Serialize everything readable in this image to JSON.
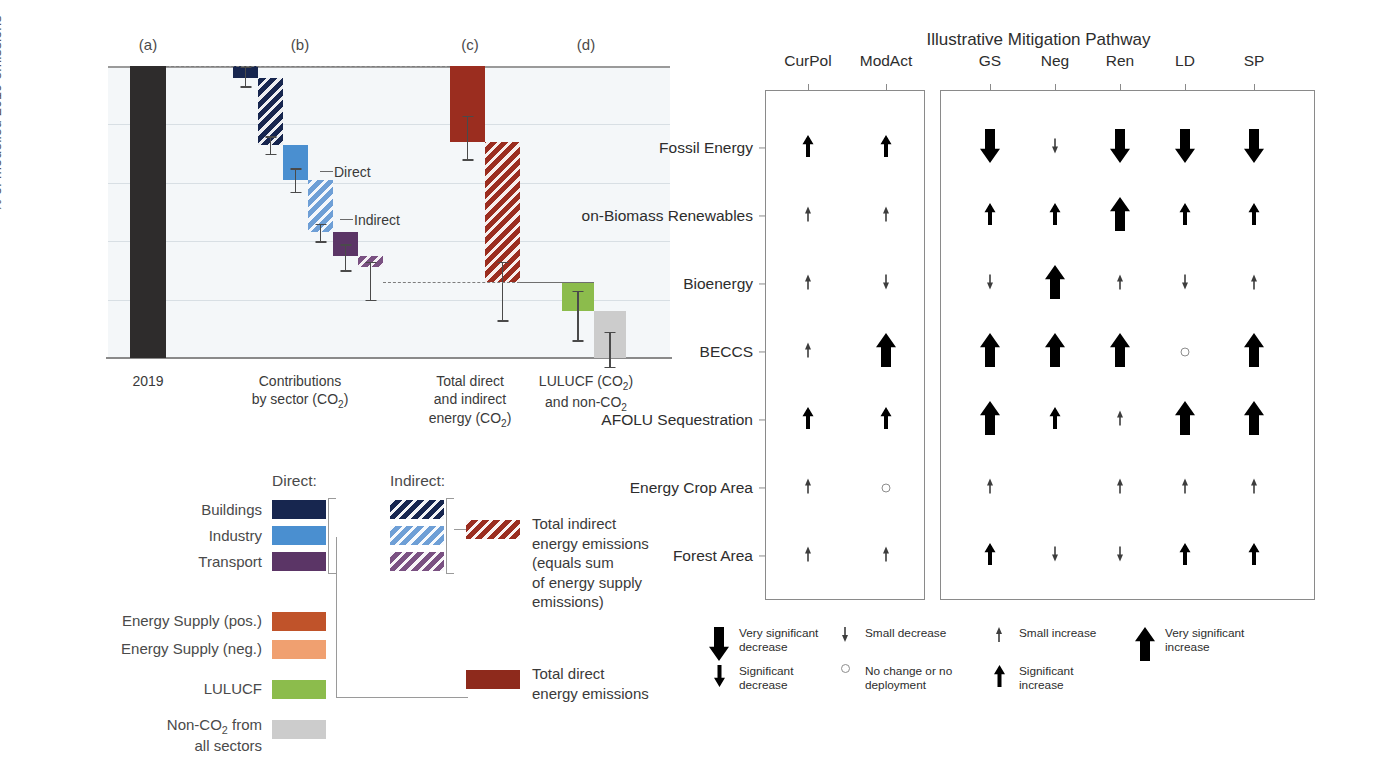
{
  "left_chart": {
    "panel_letters": [
      {
        "label": "(a)",
        "x": 148
      },
      {
        "label": "(b)",
        "x": 300
      },
      {
        "label": "(c)",
        "x": 470
      },
      {
        "label": "(d)",
        "x": 586
      }
    ],
    "y_axis": {
      "label": "% of modelled 2019 emissions",
      "ticks": [
        "100%",
        "80%",
        "60%",
        "40%",
        "20%",
        "0%"
      ],
      "min": 0,
      "max": 100
    },
    "x_categories": [
      {
        "label": "2019",
        "x": 148
      },
      {
        "label": "Contributions\nby sector (CO2)",
        "x": 300
      },
      {
        "label": "Total direct\nand indirect\nenergy (CO2)",
        "x": 470
      },
      {
        "label": "LULUCF (CO2)\nand non-CO2",
        "x": 586
      }
    ],
    "inline_labels": [
      {
        "text": "Direct",
        "x": 334,
        "y": 164
      },
      {
        "text": "Indirect",
        "x": 354,
        "y": 212
      }
    ]
  },
  "chart_data": {
    "type": "bar",
    "xlabel": "",
    "ylabel": "% of modelled 2019 emissions",
    "ylim": [
      0,
      100
    ],
    "grid": true,
    "legend_position": "below",
    "note": "Waterfall chart: each segment spans from 'top' to 'bottom' percent of modelled 2019 emissions",
    "segments": [
      {
        "name": "2019 total",
        "group": "a",
        "kind": "total",
        "top": 100,
        "bottom": 0,
        "color": "#2e2c2c",
        "hatched": false,
        "error_low": null,
        "error_high": null
      },
      {
        "name": "Buildings direct",
        "group": "b",
        "kind": "direct",
        "top": 100,
        "bottom": 96,
        "color": "#17264f",
        "hatched": false,
        "error_low": 93,
        "error_high": 100
      },
      {
        "name": "Buildings indirect",
        "group": "b",
        "kind": "indirect",
        "top": 96,
        "bottom": 73,
        "color": "#17264f",
        "hatched": true,
        "error_low": 70,
        "error_high": 76
      },
      {
        "name": "Industry direct",
        "group": "b",
        "kind": "direct",
        "top": 73,
        "bottom": 61,
        "color": "#4a8fd0",
        "hatched": false,
        "error_low": 57,
        "error_high": 65
      },
      {
        "name": "Industry indirect",
        "group": "b",
        "kind": "indirect",
        "top": 61,
        "bottom": 43,
        "color": "#6e9fd6",
        "hatched": true,
        "error_low": 40,
        "error_high": 46
      },
      {
        "name": "Transport direct",
        "group": "b",
        "kind": "direct",
        "top": 43,
        "bottom": 35,
        "color": "#5b3566",
        "hatched": false,
        "error_low": 30,
        "error_high": 39
      },
      {
        "name": "Transport indirect",
        "group": "b",
        "kind": "indirect",
        "top": 35,
        "bottom": 31,
        "color": "#7a5182",
        "hatched": true,
        "error_low": 20,
        "error_high": 33
      },
      {
        "name": "Total direct energy emissions",
        "group": "c",
        "kind": "direct",
        "top": 100,
        "bottom": 74,
        "color": "#9b2d1f",
        "hatched": false,
        "error_low": 68,
        "error_high": 83
      },
      {
        "name": "Total indirect energy emissions",
        "group": "c",
        "kind": "indirect",
        "top": 74,
        "bottom": 26,
        "color": "#9b2d1f",
        "hatched": true,
        "error_low": 13,
        "error_high": 33
      },
      {
        "name": "LULUCF (CO2)",
        "group": "d",
        "kind": "direct",
        "top": 26,
        "bottom": 16,
        "color": "#8cbc4c",
        "hatched": false,
        "error_low": 6,
        "error_high": 23
      },
      {
        "name": "Non-CO2 from all sectors",
        "group": "d",
        "kind": "direct",
        "top": 16,
        "bottom": 0,
        "color": "#cccccc",
        "hatched": false,
        "error_low": -3,
        "error_high": 9
      }
    ]
  },
  "left_legend": {
    "heading_direct": "Direct:",
    "heading_indirect": "Indirect:",
    "sector_rows": [
      {
        "label": "Buildings",
        "color": "#17264f"
      },
      {
        "label": "Industry",
        "color": "#4a8fd0"
      },
      {
        "label": "Transport",
        "color": "#5b3566"
      }
    ],
    "indirect_colors": [
      "#17264f",
      "#6e9fd6",
      "#7a5182"
    ],
    "other_rows": [
      {
        "label": "Energy Supply (pos.)",
        "color": "#c0532a"
      },
      {
        "label": "Energy Supply (neg.)",
        "color": "#f0a070"
      },
      {
        "label": "LULUCF",
        "color": "#8cbc4c"
      },
      {
        "label": "Non-CO2 from\nall sectors",
        "color": "#cccccc"
      }
    ],
    "total_indirect": {
      "color": "#9b2d1f",
      "text": "Total indirect\nenergy emissions\n(equals sum\nof energy supply\nemissions)"
    },
    "total_direct": {
      "color": "#8e2a1c",
      "text": "Total direct\nenergy emissions"
    }
  },
  "right_panel": {
    "title": "Illustrative Mitigation Pathway",
    "columns": [
      {
        "label": "CurPol",
        "x": 108,
        "group": 1
      },
      {
        "label": "ModAct",
        "x": 186,
        "group": 1
      },
      {
        "label": "GS",
        "x": 290,
        "group": 2
      },
      {
        "label": "Neg",
        "x": 355,
        "group": 2
      },
      {
        "label": "Ren",
        "x": 420,
        "group": 2
      },
      {
        "label": "LD",
        "x": 485,
        "group": 2
      },
      {
        "label": "SP",
        "x": 554,
        "group": 2
      }
    ],
    "rows": [
      {
        "label": "Fossil Energy",
        "y": 148
      },
      {
        "label": "on-Biomass Renewables",
        "y": 216
      },
      {
        "label": "Bioenergy",
        "y": 284
      },
      {
        "label": "BECCS",
        "y": 352
      },
      {
        "label": "AFOLU Sequestration",
        "y": 420
      },
      {
        "label": "Energy Crop Area",
        "y": 488
      },
      {
        "label": "Forest Area",
        "y": 556
      }
    ],
    "cells": [
      [
        "sig-inc",
        "sig-inc",
        "vsig-dec",
        "small-dec",
        "vsig-dec",
        "vsig-dec",
        "vsig-dec"
      ],
      [
        "small-inc",
        "small-inc",
        "sig-inc",
        "sig-inc",
        "vsig-inc",
        "sig-inc",
        "sig-inc"
      ],
      [
        "small-inc",
        "small-dec",
        "small-dec",
        "vsig-inc",
        "small-inc",
        "small-dec",
        "small-inc"
      ],
      [
        "small-inc",
        "vsig-inc",
        "vsig-inc",
        "vsig-inc",
        "vsig-inc",
        "no-change",
        "vsig-inc"
      ],
      [
        "sig-inc",
        "sig-inc",
        "vsig-inc",
        "sig-inc",
        "small-inc",
        "vsig-inc",
        "vsig-inc"
      ],
      [
        "small-inc",
        "no-change",
        "small-inc",
        "",
        "small-inc",
        "small-inc",
        "small-inc"
      ],
      [
        "small-inc",
        "small-inc",
        "sig-inc",
        "small-dec",
        "small-dec",
        "sig-inc",
        "sig-inc"
      ]
    ],
    "arrow_legend": [
      {
        "glyph": "vsig-dec",
        "text": "Very significant\ndecrease",
        "x": 8,
        "y": 6
      },
      {
        "glyph": "sig-dec",
        "text": "Significant\ndecrease",
        "x": 8,
        "y": 44
      },
      {
        "glyph": "small-dec",
        "text": "Small decrease",
        "x": 134,
        "y": 6
      },
      {
        "glyph": "no-change",
        "text": "No change or no\ndeployment",
        "x": 134,
        "y": 44
      },
      {
        "glyph": "small-inc",
        "text": "Small increase",
        "x": 288,
        "y": 6
      },
      {
        "glyph": "sig-inc",
        "text": "Significant\nincrease",
        "x": 288,
        "y": 44
      },
      {
        "glyph": "vsig-inc",
        "text": "Very significant\nincrease",
        "x": 434,
        "y": 6
      }
    ]
  },
  "arrow_styles": {
    "vsig-dec": {
      "dir": "down",
      "shaft_w": 10,
      "head_w": 20,
      "height": 34,
      "color": "#000000"
    },
    "sig-dec": {
      "dir": "down",
      "shaft_w": 4,
      "head_w": 11,
      "height": 22,
      "color": "#000000"
    },
    "small-dec": {
      "dir": "down",
      "shaft_w": 1.6,
      "head_w": 6,
      "height": 15,
      "color": "#3d3d3d"
    },
    "small-inc": {
      "dir": "up",
      "shaft_w": 1.6,
      "head_w": 6,
      "height": 15,
      "color": "#3d3d3d"
    },
    "sig-inc": {
      "dir": "up",
      "shaft_w": 4,
      "head_w": 11,
      "height": 22,
      "color": "#000000"
    },
    "vsig-inc": {
      "dir": "up",
      "shaft_w": 10,
      "head_w": 20,
      "height": 34,
      "color": "#000000"
    }
  }
}
